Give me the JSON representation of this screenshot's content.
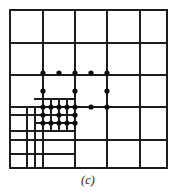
{
  "figure": {
    "caption": "(c)",
    "stroke_color": "#1c1c1c",
    "point_color": "#0d0d0d",
    "background": "#ffffff"
  },
  "chart_data": {
    "type": "scatter",
    "title": "(c)",
    "xlabel": "",
    "ylabel": "",
    "xlim": [
      10,
      167
    ],
    "ylim": [
      10,
      168
    ],
    "grid": true,
    "legend": "none",
    "point_radius": 2.6,
    "points": [
      {
        "x": 43,
        "y": 73
      },
      {
        "x": 59,
        "y": 73
      },
      {
        "x": 75,
        "y": 73
      },
      {
        "x": 91,
        "y": 73
      },
      {
        "x": 107,
        "y": 73
      },
      {
        "x": 43,
        "y": 91
      },
      {
        "x": 75,
        "y": 91
      },
      {
        "x": 107,
        "y": 91
      },
      {
        "x": 43,
        "y": 107
      },
      {
        "x": 51,
        "y": 107
      },
      {
        "x": 59,
        "y": 107
      },
      {
        "x": 67,
        "y": 107
      },
      {
        "x": 75,
        "y": 107
      },
      {
        "x": 91,
        "y": 107
      },
      {
        "x": 107,
        "y": 107
      },
      {
        "x": 43,
        "y": 115
      },
      {
        "x": 59,
        "y": 115
      },
      {
        "x": 75,
        "y": 115
      },
      {
        "x": 43,
        "y": 123
      },
      {
        "x": 51,
        "y": 123
      },
      {
        "x": 59,
        "y": 123
      },
      {
        "x": 67,
        "y": 123
      },
      {
        "x": 75,
        "y": 123
      }
    ],
    "grid_lines": {
      "base_vertical_x": [
        10,
        43,
        75,
        107,
        140,
        167
      ],
      "base_horizontal_y": [
        10,
        43,
        75,
        107,
        140,
        168
      ],
      "extra_vertical": [
        {
          "x": 27,
          "y1": 107,
          "y2": 168
        },
        {
          "x": 35,
          "y1": 107,
          "y2": 168
        },
        {
          "x": 51,
          "y1": 99,
          "y2": 131
        },
        {
          "x": 59,
          "y1": 99,
          "y2": 131
        },
        {
          "x": 67,
          "y1": 99,
          "y2": 131
        }
      ],
      "extra_horizontal": [
        {
          "y": 99,
          "x1": 35,
          "x2": 75
        },
        {
          "y": 115,
          "x1": 10,
          "x2": 75
        },
        {
          "y": 123,
          "x1": 35,
          "x2": 75
        },
        {
          "y": 131,
          "x1": 10,
          "x2": 75
        },
        {
          "y": 154,
          "x1": 10,
          "x2": 75
        }
      ]
    }
  }
}
